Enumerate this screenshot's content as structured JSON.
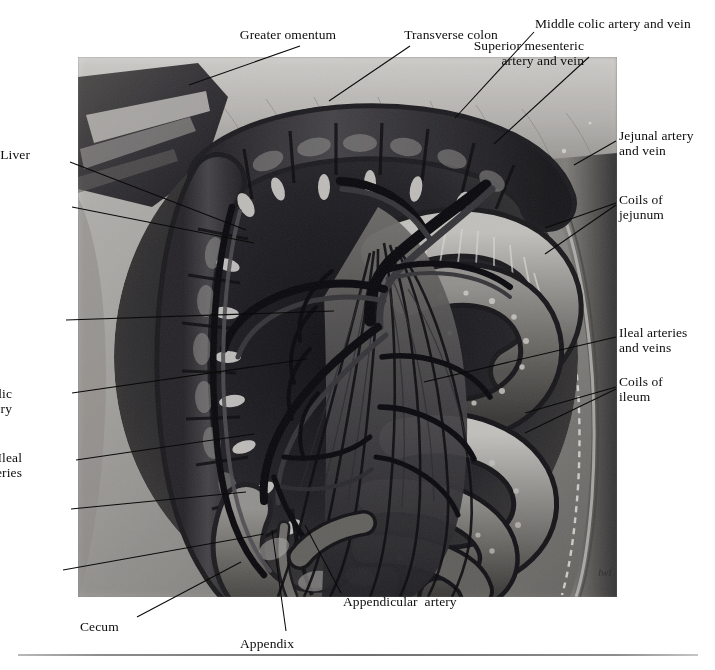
{
  "figure": {
    "type": "anatomical-illustration",
    "medium": "grayscale-airbrush-plate",
    "signature": "lwl",
    "plate": {
      "x": 78,
      "y": 57,
      "width": 539,
      "height": 540
    }
  },
  "labels": [
    {
      "id": "greater-omentum",
      "text": "Greater omentum",
      "align": "center",
      "x": 228,
      "y": 27,
      "leader": {
        "x1": 300,
        "y1": 46,
        "x2": 189,
        "y2": 85
      }
    },
    {
      "id": "transverse-colon",
      "text": "Transverse colon",
      "align": "center",
      "x": 391,
      "y": 27,
      "leader": {
        "x1": 410,
        "y1": 46,
        "x2": 329,
        "y2": 101
      }
    },
    {
      "id": "middle-colic-artery-and-vein",
      "text": "Middle colic artery and vein",
      "align": "left",
      "x": 535,
      "y": 16,
      "leader": {
        "x1": 534,
        "y1": 32,
        "x2": 455,
        "y2": 118
      }
    },
    {
      "id": "superior-mesenteric-artery-and-vein",
      "text": "Superior mesenteric\nartery and vein",
      "align": "right",
      "x": 584,
      "y": 38,
      "lineCount": 2,
      "leader": {
        "x1": 589,
        "y1": 57,
        "x2": 494,
        "y2": 144
      }
    },
    {
      "id": "jejunal-artery-and-vein",
      "text": "Jejunal artery\nand vein",
      "align": "left",
      "x": 619,
      "y": 128,
      "lineCount": 2,
      "leader": {
        "x1": 616,
        "y1": 141,
        "x2": 574,
        "y2": 165
      }
    },
    {
      "id": "coils-of-jejunum",
      "text": "Coils of\njejunum",
      "align": "left",
      "x": 619,
      "y": 192,
      "lineCount": 2,
      "leaders": [
        {
          "x1": 616,
          "y1": 203,
          "x2": 545,
          "y2": 228
        },
        {
          "x1": 616,
          "y1": 205,
          "x2": 545,
          "y2": 254
        }
      ]
    },
    {
      "id": "ileal-arteries-and-veins",
      "text": "Ileal arteries\nand veins",
      "align": "left",
      "x": 619,
      "y": 325,
      "lineCount": 2,
      "leader": {
        "x1": 616,
        "y1": 337,
        "x2": 424,
        "y2": 382
      }
    },
    {
      "id": "coils-of-ileum",
      "text": "Coils of\nileum",
      "align": "left",
      "x": 619,
      "y": 374,
      "lineCount": 2,
      "leaders": [
        {
          "x1": 616,
          "y1": 387,
          "x2": 525,
          "y2": 413
        },
        {
          "x1": 616,
          "y1": 389,
          "x2": 525,
          "y2": 433
        }
      ]
    },
    {
      "id": "liver",
      "text": "Liver",
      "align": "right",
      "x": 30,
      "y": 147,
      "leader": {
        "x1": 70,
        "y1": 162,
        "x2": 246,
        "y2": 230
      }
    },
    {
      "id": "gallbladder",
      "text": "Gallbladder",
      "align": "right",
      "x": -4,
      "y": 198,
      "clipped": true,
      "leader": {
        "x1": 72,
        "y1": 207,
        "x2": 254,
        "y2": 243
      }
    },
    {
      "id": "right-colic-artery",
      "text": "Right  colic\nartery",
      "align": "right",
      "x": -2,
      "y": 305,
      "lineCount": 2,
      "clipped": true,
      "leader": {
        "x1": 66,
        "y1": 320,
        "x2": 334,
        "y2": 311
      }
    },
    {
      "id": "ileocolic-artery",
      "text": "Ileocolic\nartery",
      "align": "right",
      "x": 12,
      "y": 386,
      "lineCount": 2,
      "clipped": true,
      "leader": {
        "x1": 72,
        "y1": 393,
        "x2": 307,
        "y2": 359
      }
    },
    {
      "id": "ileal-arteries",
      "text": "Ileal\narteries",
      "align": "right",
      "x": 22,
      "y": 450,
      "lineCount": 2,
      "leader": {
        "x1": 76,
        "y1": 460,
        "x2": 254,
        "y2": 434
      }
    },
    {
      "id": "ascending-colon",
      "text": "Ascending\ncolon",
      "align": "right",
      "x": -2,
      "y": 500,
      "lineCount": 2,
      "clipped": true,
      "leader": {
        "x1": 71,
        "y1": 509,
        "x2": 246,
        "y2": 492
      }
    },
    {
      "id": "anterior-cecal-artery",
      "text": "Anterior\ncecal  artery",
      "align": "right",
      "x": -8,
      "y": 568,
      "lineCount": 2,
      "clipped": true,
      "leader": {
        "x1": 63,
        "y1": 570,
        "x2": 264,
        "y2": 534
      }
    },
    {
      "id": "cecum",
      "text": "Cecum",
      "align": "left",
      "x": 80,
      "y": 619,
      "leader": {
        "x1": 137,
        "y1": 617,
        "x2": 241,
        "y2": 562
      }
    },
    {
      "id": "appendix",
      "text": "Appendix",
      "align": "left",
      "x": 240,
      "y": 636,
      "leader": {
        "x1": 286,
        "y1": 631,
        "x2": 272,
        "y2": 530
      }
    },
    {
      "id": "appendicular-artery",
      "text": "Appendicular  artery",
      "align": "left",
      "x": 343,
      "y": 594,
      "leader": {
        "x1": 341,
        "y1": 593,
        "x2": 305,
        "y2": 525
      }
    }
  ],
  "rule": {
    "present": true,
    "x": 18,
    "y": 654,
    "width": 680
  },
  "colors": {
    "background": "#ffffff",
    "text": "#0d0d0d",
    "leader": "#0a0a0a",
    "plate_light": "#d8d6d2",
    "plate_mid": "#8e8c88",
    "plate_dark": "#3a3836",
    "plate_deepest": "#16161a",
    "rule": "#6f6f6f"
  }
}
